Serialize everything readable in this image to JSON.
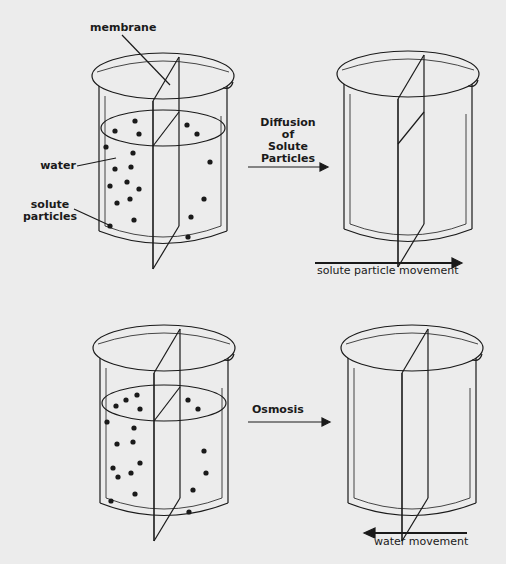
{
  "labels": {
    "membrane": "membrane",
    "water": "water",
    "solute_line1": "solute",
    "solute_line2": "particles",
    "diffusion_l1": "Diffusion",
    "diffusion_l2": "of",
    "diffusion_l3": "Solute",
    "diffusion_l4": "Particles",
    "solute_movement": "solute particle movement",
    "osmosis": "Osmosis",
    "water_movement": "water movement"
  },
  "colors": {
    "background": "#ececec",
    "ink": "#1a1a1a"
  },
  "panels": [
    {
      "name": "diffusion-before",
      "particles_left": 13,
      "particles_right": 7
    },
    {
      "name": "diffusion-after",
      "particles": 0
    },
    {
      "name": "osmosis-before",
      "particles_left": 14,
      "particles_right": 7
    },
    {
      "name": "osmosis-after",
      "particles": 0
    }
  ]
}
